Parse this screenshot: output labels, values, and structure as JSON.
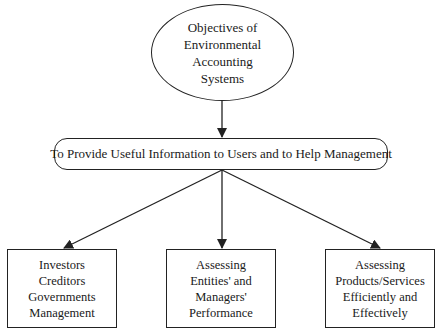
{
  "diagram": {
    "root": {
      "lines": [
        "Objectives of",
        "Environmental",
        "Accounting",
        "Systems"
      ]
    },
    "goal": {
      "label": "To Provide Useful Information to Users and to Help Management"
    },
    "children": [
      {
        "lines": [
          "Investors",
          "Creditors",
          "Governments",
          "Management"
        ]
      },
      {
        "lines": [
          "Assessing",
          "Entities' and",
          "Managers'",
          "Performance"
        ]
      },
      {
        "lines": [
          "Assessing",
          "Products/Services",
          "Efficiently and",
          "Effectively"
        ]
      }
    ],
    "edges": [
      {
        "from": "root",
        "to": "goal"
      },
      {
        "from": "goal",
        "to": "child-0"
      },
      {
        "from": "goal",
        "to": "child-1"
      },
      {
        "from": "goal",
        "to": "child-2"
      }
    ],
    "colors": {
      "stroke": "#222222",
      "background": "#ffffff",
      "text": "#1a1a1a"
    }
  }
}
